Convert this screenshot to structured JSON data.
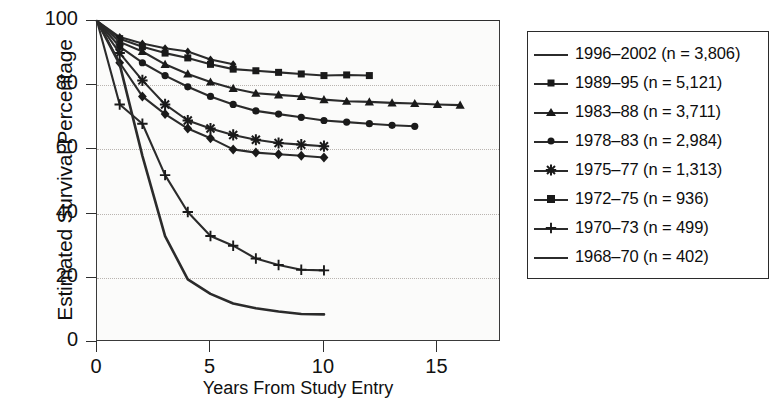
{
  "chart_data": {
    "type": "line",
    "title": "",
    "xlabel": "Years From Study Entry",
    "ylabel": "Estimated Survival Percentage",
    "xlim": [
      0,
      17.8
    ],
    "ylim": [
      0,
      100
    ],
    "xticks": [
      0,
      5,
      10,
      15
    ],
    "yticks": [
      0,
      20,
      40,
      60,
      80,
      100
    ],
    "xtick_labels": [
      "0",
      "5",
      "10",
      "15"
    ],
    "ytick_labels": [
      "0",
      "20",
      "40",
      "60",
      "80",
      "100"
    ],
    "gridlines_y": [
      20,
      40,
      60,
      80
    ],
    "grid": "horizontal-dotted",
    "legend_position": "right-outside",
    "series": [
      {
        "name": "1996–2002 (n = 3,806)",
        "marker": "diamond-small",
        "x": [
          0,
          1,
          2,
          3,
          4,
          5,
          6
        ],
        "y": [
          100,
          95,
          93,
          91.5,
          90.5,
          88,
          86.5
        ]
      },
      {
        "name": "1989–95 (n = 5,121)",
        "marker": "square",
        "x": [
          0,
          1,
          2,
          3,
          4,
          5,
          6,
          7,
          8,
          9,
          10,
          11,
          12
        ],
        "y": [
          100,
          94.5,
          92,
          90,
          88.5,
          86.5,
          85,
          84.5,
          84,
          83.5,
          83,
          83.2,
          83
        ]
      },
      {
        "name": "1983–88 (n = 3,711)",
        "marker": "triangle",
        "x": [
          0,
          1,
          2,
          3,
          4,
          5,
          6,
          7,
          8,
          9,
          10,
          11,
          12,
          13,
          14,
          15,
          16
        ],
        "y": [
          100,
          93.5,
          90.5,
          86.5,
          83.5,
          81,
          79,
          77.5,
          77,
          76.5,
          75.5,
          75,
          74.8,
          74.5,
          74.3,
          74,
          73.8
        ]
      },
      {
        "name": "1978–83 (n = 2,984)",
        "marker": "circle",
        "x": [
          0,
          1,
          2,
          3,
          4,
          5,
          6,
          7,
          8,
          9,
          10,
          11,
          12,
          13,
          14
        ],
        "y": [
          100,
          92,
          87,
          83,
          79.5,
          76.5,
          74,
          72,
          71,
          70,
          69,
          68.5,
          68,
          67.5,
          67.2
        ]
      },
      {
        "name": "1975–77 (n = 1,313)",
        "marker": "asterisk",
        "x": [
          0,
          1,
          2,
          3,
          4,
          5,
          6,
          7,
          8,
          9,
          10
        ],
        "y": [
          100,
          90,
          81.5,
          74,
          69,
          66.5,
          64.5,
          63,
          62,
          61.5,
          61
        ]
      },
      {
        "name": "1972–75 (n = 936)",
        "marker": "diamond",
        "x": [
          0,
          1,
          2,
          3,
          4,
          5,
          6,
          7,
          8,
          9,
          10
        ],
        "y": [
          100,
          87,
          76.5,
          71,
          66.5,
          63.5,
          60,
          59,
          58.5,
          58,
          57.5
        ]
      },
      {
        "name": "1970–73 (n = 499)",
        "marker": "plus",
        "x": [
          0,
          1,
          2,
          3,
          4,
          5,
          6,
          7,
          8,
          9,
          10
        ],
        "y": [
          100,
          74,
          68,
          52,
          40.5,
          33,
          30,
          26,
          24,
          22.5,
          22.3
        ]
      },
      {
        "name": "1968–70 (n = 402)",
        "marker": "none",
        "x": [
          0,
          1,
          2,
          3,
          4,
          5,
          6,
          7,
          8,
          9,
          10
        ],
        "y": [
          100,
          86.5,
          58,
          33,
          19.5,
          15,
          12,
          10.5,
          9.5,
          8.7,
          8.6
        ]
      }
    ]
  },
  "axes": {
    "ylabel": "Estimated Survival Percentage",
    "xlabel": "Years From Study Entry"
  },
  "legend": {
    "items": [
      {
        "label": "1996–2002 (n = 3,806)",
        "marker": "diamond-small"
      },
      {
        "label": "1989–95 (n = 5,121)",
        "marker": "square"
      },
      {
        "label": "1983–88 (n = 3,711)",
        "marker": "triangle"
      },
      {
        "label": "1978–83 (n = 2,984)",
        "marker": "circle"
      },
      {
        "label": "1975–77 (n = 1,313)",
        "marker": "asterisk"
      },
      {
        "label": "1972–75 (n = 936)",
        "marker": "diamond"
      },
      {
        "label": "1970–73 (n = 499)",
        "marker": "plus"
      },
      {
        "label": "1968–70 (n = 402)",
        "marker": "none"
      }
    ]
  },
  "colors": {
    "line": "#2b2b2b",
    "marker": "#1a1a1a",
    "grid": "#b9b4b0",
    "axis": "#2f2f2f",
    "plot_background": "#fbfbfa"
  }
}
